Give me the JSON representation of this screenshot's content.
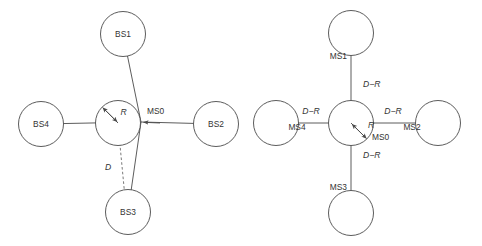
{
  "figure": {
    "background_color": "#ffffff",
    "stroke_color": "#4a4a4a",
    "text_color": "#333333",
    "panels": [
      {
        "id": "left-panel",
        "name": "base-station-geometry",
        "description": "Cross layout of four base stations around a central mobile station",
        "center_label": "MS0",
        "center_radius_label": "R",
        "distance_label": "D",
        "nodes": [
          {
            "id": "bs1",
            "label": "BS1",
            "position": "top"
          },
          {
            "id": "bs2",
            "label": "BS2",
            "position": "right"
          },
          {
            "id": "bs3",
            "label": "BS3",
            "position": "bottom"
          },
          {
            "id": "bs4",
            "label": "BS4",
            "position": "left"
          }
        ]
      },
      {
        "id": "right-panel",
        "name": "mobile-station-geometry",
        "description": "Cross layout of four mobile stations around a central mobile station",
        "center_label": "MS0",
        "center_radius_label": "R",
        "arm_label": "D−R",
        "nodes": [
          {
            "id": "ms1",
            "label": "MS1",
            "position": "top"
          },
          {
            "id": "ms2",
            "label": "MS2",
            "position": "right"
          },
          {
            "id": "ms3",
            "label": "MS3",
            "position": "bottom"
          },
          {
            "id": "ms4",
            "label": "MS4",
            "position": "left"
          }
        ],
        "arm_labels": [
          {
            "id": "arm-top",
            "text": "D−R"
          },
          {
            "id": "arm-right",
            "text": "D−R"
          },
          {
            "id": "arm-bottom",
            "text": "D−R"
          },
          {
            "id": "arm-left",
            "text": "D−R"
          }
        ]
      }
    ]
  }
}
